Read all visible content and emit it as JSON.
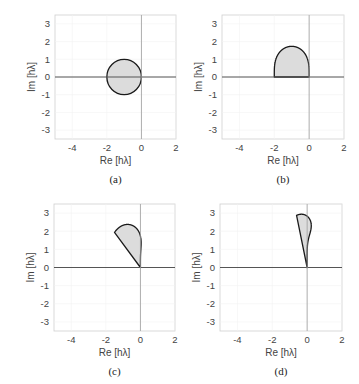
{
  "chart_data": [
    {
      "id": "a",
      "type": "area",
      "method": "Forward Euler (order 1)",
      "order": 1,
      "caption": "(a)",
      "xlabel": "Re [hλ]",
      "ylabel": "Im [hλ]",
      "xlim": [
        -5,
        2
      ],
      "ylim": [
        -3.5,
        3.5
      ],
      "xticks": [
        -4,
        -2,
        0,
        2
      ],
      "yticks": [
        3,
        2,
        1,
        0,
        -1,
        -2,
        -3
      ],
      "grid": true,
      "region": {
        "shape": "circle",
        "center": [
          -1,
          0
        ],
        "radius": 1
      },
      "fill": "#dcdcdc",
      "stroke": "#1a1a1a"
    },
    {
      "id": "b",
      "type": "area",
      "method": "RK2 (order 2)",
      "order": 2,
      "caption": "(b)",
      "xlabel": "Re [hλ]",
      "ylabel": "Im [hλ]",
      "xlim": [
        -5,
        2
      ],
      "ylim": [
        -3.5,
        3.5
      ],
      "xticks": [
        -4,
        -2,
        0,
        2
      ],
      "yticks": [
        3,
        2,
        1,
        0,
        -1,
        -2,
        -3
      ],
      "grid": true,
      "region": {
        "shape": "stability_polynomial",
        "re_range": [
          -2,
          0
        ],
        "im_max": 1.73
      },
      "fill": "#dcdcdc",
      "stroke": "#1a1a1a"
    },
    {
      "id": "c",
      "type": "area",
      "method": "RK3 (order 3)",
      "order": 3,
      "caption": "(c)",
      "xlabel": "Re [hλ]",
      "ylabel": "Im [hλ]",
      "xlim": [
        -5,
        2
      ],
      "ylim": [
        -3.5,
        3.5
      ],
      "xticks": [
        -4,
        -2,
        0,
        2
      ],
      "yticks": [
        3,
        2,
        1,
        0,
        -1,
        -2,
        -3
      ],
      "grid": true,
      "region": {
        "shape": "stability_polynomial",
        "re_min": -2.51,
        "im_max": 2.4
      },
      "fill": "#dcdcdc",
      "stroke": "#1a1a1a"
    },
    {
      "id": "d",
      "type": "area",
      "method": "RK4 (order 4)",
      "order": 4,
      "caption": "(d)",
      "xlabel": "Re [hλ]",
      "ylabel": "Im [hλ]",
      "xlim": [
        -5,
        2
      ],
      "ylim": [
        -3.5,
        3.5
      ],
      "xticks": [
        -4,
        -2,
        0,
        2
      ],
      "yticks": [
        3,
        2,
        1,
        0,
        -1,
        -2,
        -3
      ],
      "grid": true,
      "region": {
        "shape": "stability_polynomial",
        "re_min": -2.79,
        "im_max": 2.83
      },
      "fill": "#dcdcdc",
      "stroke": "#1a1a1a"
    }
  ],
  "layout": {
    "panels": [
      {
        "x": 55,
        "y": 15,
        "w": 121,
        "h": 124
      },
      {
        "x": 222,
        "y": 15,
        "w": 122,
        "h": 124
      },
      {
        "x": 54,
        "y": 204,
        "w": 121,
        "h": 127
      },
      {
        "x": 220,
        "y": 204,
        "w": 122,
        "h": 127
      }
    ]
  }
}
